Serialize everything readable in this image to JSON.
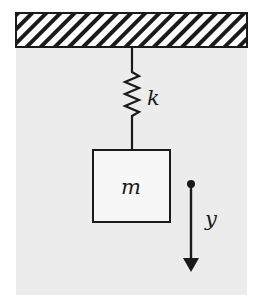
{
  "diagram": {
    "labels": {
      "spring_constant": "k",
      "mass": "m",
      "displacement": "y"
    },
    "colors": {
      "background": "#ffffff",
      "panel": "#ececec",
      "stroke": "#1a1a1a",
      "mass_fill": "#f7f7f7",
      "ceiling_fill": "#ffffff"
    },
    "elements": {
      "ceiling": "hatched fixed support",
      "spring": "zigzag spring",
      "mass_block": "mass block",
      "arrow": "downward displacement arrow with origin dot"
    }
  }
}
